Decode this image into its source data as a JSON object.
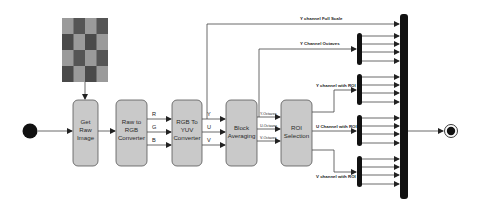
{
  "diagram": {
    "type": "activity-flow",
    "colors": {
      "box_fill": "#c9c9c9",
      "box_stroke": "#555555",
      "bar": "#111111",
      "line": "#444444",
      "checker_dark": "#4a4a4a",
      "checker_light": "#9a9a9a"
    },
    "start_node": {
      "label": ""
    },
    "end_node": {
      "label": ""
    },
    "input_image": {
      "label": "",
      "pattern": "checkerboard",
      "rows": 4,
      "cols": 4
    },
    "nodes": [
      {
        "id": "get_raw",
        "lines": [
          "Get",
          "Raw",
          "Image"
        ]
      },
      {
        "id": "raw_to_rgb",
        "lines": [
          "Raw to",
          "RGB",
          "Converter"
        ]
      },
      {
        "id": "rgb_to_yuv",
        "lines": [
          "RGB To",
          "YUV",
          "Converter"
        ]
      },
      {
        "id": "block_avg",
        "lines": [
          "Block",
          "Averaging"
        ]
      },
      {
        "id": "roi_sel",
        "lines": [
          "ROI",
          "Selection"
        ]
      }
    ],
    "edges": {
      "rgb": [
        "R",
        "G",
        "B"
      ],
      "yuv": [
        "Y",
        "U",
        "V"
      ],
      "octaves": [
        "Y-Octaves",
        "U-Octaves",
        "V-Octaves"
      ],
      "y_full_scale": "Y channel Full Scale",
      "y_octaves": "Y Channel Octaves",
      "y_roi": "Y channel with ROI",
      "u_roi": "U Channel with ROI",
      "v_roi": "V channel with ROI"
    }
  }
}
